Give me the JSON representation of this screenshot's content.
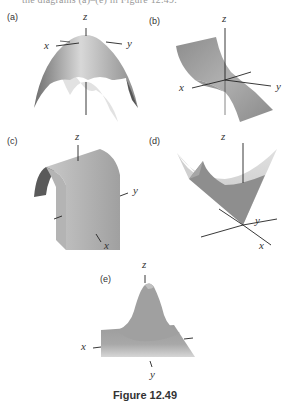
{
  "figure": {
    "cut_header_text": "the diagrams (a)–(e) in Figure 12.49.",
    "caption": "Figure 12.49",
    "panels": [
      {
        "id": "a",
        "label": "(a)",
        "surface": "downward paraboloid (dome)",
        "axes": {
          "x": "x",
          "y": "y",
          "z": "z"
        }
      },
      {
        "id": "b",
        "label": "(b)",
        "surface": "saddle / cubic sheet",
        "axes": {
          "x": "x",
          "y": "y",
          "z": "z"
        }
      },
      {
        "id": "c",
        "label": "(c)",
        "surface": "parabolic cylinder (arch)",
        "axes": {
          "x": "x",
          "y": "y",
          "z": "z"
        }
      },
      {
        "id": "d",
        "label": "(d)",
        "surface": "cone opening upward",
        "axes": {
          "x": "x",
          "y": "y",
          "z": "z"
        }
      },
      {
        "id": "e",
        "label": "(e)",
        "surface": "gaussian bump",
        "axes": {
          "x": "x",
          "y": "y",
          "z": "z"
        }
      }
    ]
  }
}
